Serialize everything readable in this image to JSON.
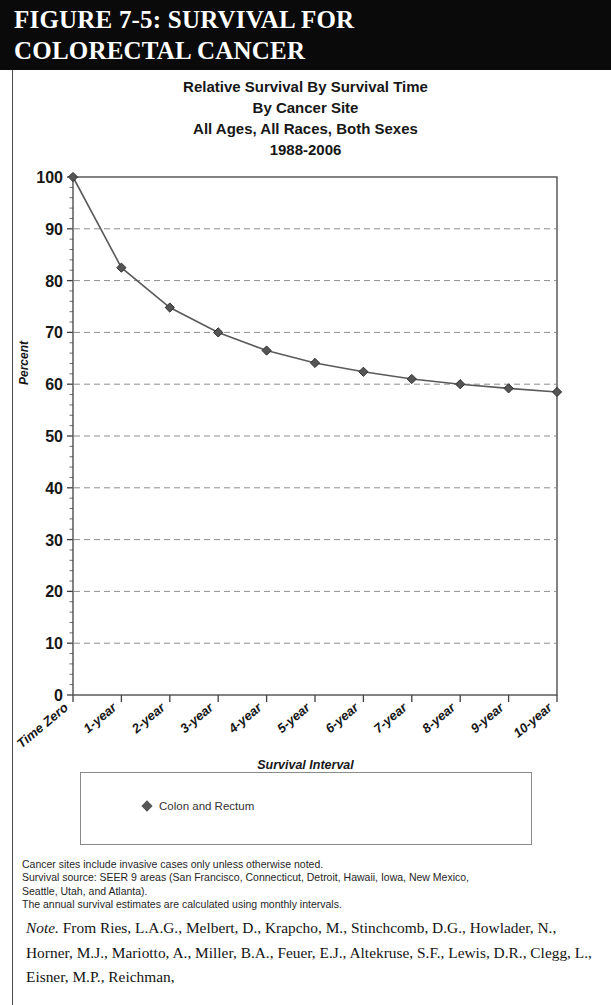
{
  "figure": {
    "header_line1": "FIGURE 7-5: SURVIVAL FOR",
    "header_line2": "COLORECTAL CANCER"
  },
  "chart_titles": [
    "Relative Survival By Survival Time",
    "By Cancer Site",
    "All Ages, All Races, Both Sexes",
    "1988-2006"
  ],
  "legend": {
    "series_label": "Colon and Rectum",
    "marker": "diamond-marker"
  },
  "footnotes": [
    "Cancer sites include invasive cases only unless otherwise noted.",
    "Survival source: SEER 9 areas (San Francisco, Connecticut, Detroit, Hawaii, Iowa, New Mexico,",
    "Seattle, Utah, and Atlanta).",
    "The annual survival estimates are calculated using monthly intervals."
  ],
  "note": {
    "prefix": "Note.",
    "body": " From Ries, L.A.G., Melbert, D., Krapcho, M., Stinchcomb, D.G., Howlader, N., Horner, M.J., Mariotto, A., Miller, B.A., Feuer, E.J., Altekruse, S.F., Lewis, D.R., Clegg, L., Eisner, M.P., Reichman,"
  },
  "chart_data": {
    "type": "line",
    "xlabel": "Survival Interval",
    "ylabel": "Percent",
    "categories": [
      "Time Zero",
      "1-year",
      "2-year",
      "3-year",
      "4-year",
      "5-year",
      "6-year",
      "7-year",
      "8-year",
      "9-year",
      "10-year"
    ],
    "series": [
      {
        "name": "Colon and Rectum",
        "values": [
          100,
          82.5,
          74.8,
          70.0,
          66.5,
          64.1,
          62.4,
          61.0,
          60.0,
          59.2,
          58.5
        ],
        "color": "#5a5a5a",
        "marker": "diamond"
      }
    ],
    "ylim": [
      0,
      100
    ],
    "ytick_step": 10,
    "yticks": [
      0,
      10,
      20,
      30,
      40,
      50,
      60,
      70,
      80,
      90,
      100
    ],
    "grid": "horizontal-dashed",
    "legend_position": "bottom"
  }
}
